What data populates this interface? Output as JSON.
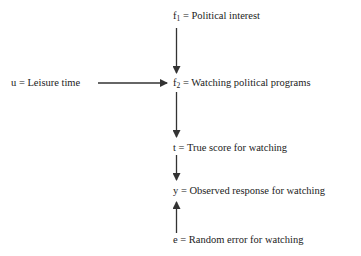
{
  "diagram": {
    "nodes": {
      "f1": {
        "var": "f",
        "sub": "1",
        "label": " = Political interest"
      },
      "f2": {
        "var": "f",
        "sub": "2",
        "label": " = Watching political programs"
      },
      "u": {
        "var": "u",
        "label": " = Leisure time"
      },
      "t": {
        "var": "t",
        "label": " = True score for watching"
      },
      "y": {
        "var": "y",
        "label": " = Observed response for watching"
      },
      "e": {
        "var": "e",
        "label": " = Random error for watching"
      }
    },
    "edges": [
      {
        "from": "f1",
        "to": "f2"
      },
      {
        "from": "u",
        "to": "f2"
      },
      {
        "from": "f2",
        "to": "t"
      },
      {
        "from": "t",
        "to": "y"
      },
      {
        "from": "e",
        "to": "y"
      }
    ],
    "colors": {
      "line": "#333333",
      "text": "#222222",
      "background": "#ffffff"
    }
  }
}
